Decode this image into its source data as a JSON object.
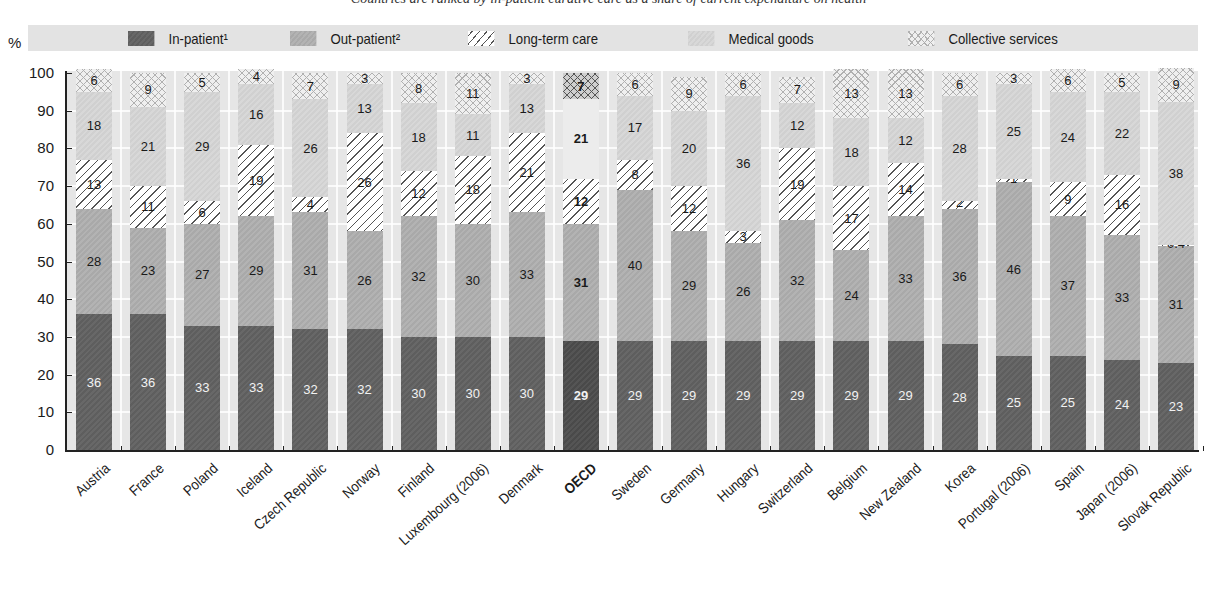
{
  "chart_data": {
    "type": "bar",
    "stacked": true,
    "title": "",
    "subtitle": "Countries are ranked by in-patient curative care as a share of current expenditure on health",
    "xlabel": "",
    "ylabel": "%",
    "ylim": [
      0,
      100
    ],
    "yticks": [
      0,
      10,
      20,
      30,
      40,
      50,
      60,
      70,
      80,
      90,
      100
    ],
    "grid": true,
    "legend_position": "top",
    "highlight_category": "OECD",
    "categories": [
      "Austria",
      "France",
      "Poland",
      "Iceland",
      "Czech Republic",
      "Norway",
      "Finland",
      "Luxembourg (2006)",
      "Denmark",
      "OECD",
      "Sweden",
      "Germany",
      "Hungary",
      "Switzerland",
      "Belgium",
      "New Zealand",
      "Korea",
      "Portugal (2006)",
      "Spain",
      "Japan (2006)",
      "Slovak Republic"
    ],
    "series": [
      {
        "name": "In-patient¹",
        "key": "inp",
        "color": "#626262",
        "values": [
          36,
          36,
          33,
          33,
          32,
          32,
          30,
          30,
          30,
          29,
          29,
          29,
          29,
          29,
          29,
          29,
          28,
          25,
          25,
          24,
          23
        ]
      },
      {
        "name": "Out-patient²",
        "key": "outp",
        "color": "#aeaeae",
        "values": [
          28,
          23,
          27,
          29,
          31,
          26,
          32,
          30,
          33,
          31,
          40,
          29,
          26,
          32,
          24,
          33,
          36,
          46,
          37,
          33,
          31
        ]
      },
      {
        "name": "Long-term care",
        "key": "ltc",
        "color": "#ffffff",
        "pattern": "diagonal-hatch",
        "values": [
          13,
          11,
          6,
          19,
          4,
          26,
          12,
          18,
          21,
          12,
          8,
          12,
          3,
          19,
          17,
          14,
          2,
          1,
          9,
          16,
          0.4
        ]
      },
      {
        "name": "Medical goods",
        "key": "med",
        "color": "#d4d4d4",
        "values": [
          18,
          21,
          29,
          16,
          26,
          13,
          18,
          11,
          13,
          21,
          17,
          20,
          36,
          12,
          18,
          12,
          28,
          25,
          24,
          22,
          38
        ]
      },
      {
        "name": "Collective services",
        "key": "coll",
        "color": "#efefef",
        "pattern": "crosshatch",
        "values": [
          6,
          9,
          5,
          4,
          7,
          3,
          8,
          11,
          3,
          7,
          6,
          9,
          6,
          7,
          13,
          13,
          6,
          3,
          6,
          5,
          9
        ]
      }
    ]
  },
  "legend": {
    "percent_label": "%",
    "items": [
      {
        "label": "In-patient¹"
      },
      {
        "label": "Out-patient²"
      },
      {
        "label": "Long-term care"
      },
      {
        "label": "Medical goods"
      },
      {
        "label": "Collective services"
      }
    ]
  }
}
